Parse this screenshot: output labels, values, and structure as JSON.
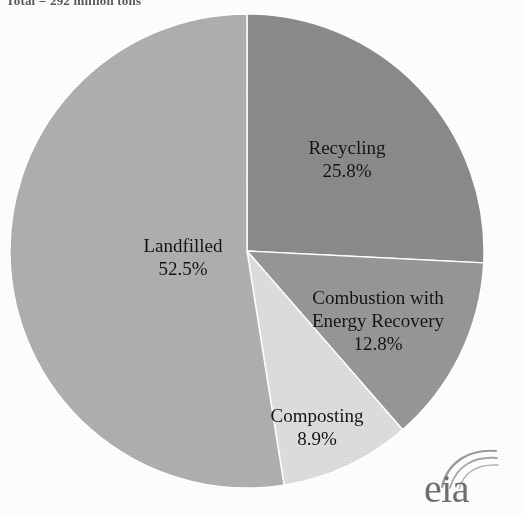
{
  "header": {
    "title": "Total = 292 million tons"
  },
  "logo": {
    "text": "eia",
    "swoosh": "arc-swoosh-icon"
  },
  "chart_data": {
    "type": "pie",
    "title": "Total = 292 million tons",
    "start_angle_deg": 0,
    "direction": "clockwise",
    "legend": "none",
    "grid": false,
    "categories": [
      "Recycling",
      "Combustion with Energy Recovery",
      "Composting",
      "Landfilled"
    ],
    "values": [
      25.8,
      12.8,
      8.9,
      52.5
    ],
    "unit": "%",
    "colors": [
      "#8a8a8a",
      "#969696",
      "#dcdcdc",
      "#aeaeae"
    ],
    "slices": [
      {
        "name": "Recycling",
        "label_line1": "Recycling",
        "label_line2": "25.8%",
        "value": 25.8,
        "color": "#8a8a8a"
      },
      {
        "name": "Combustion with Energy Recovery",
        "label_line1": "Combustion with",
        "label_line2": "Energy Recovery",
        "label_line3": "12.8%",
        "value": 12.8,
        "color": "#969696"
      },
      {
        "name": "Composting",
        "label_line1": "Composting",
        "label_line2": "8.9%",
        "value": 8.9,
        "color": "#dcdcdc"
      },
      {
        "name": "Landfilled",
        "label_line1": "Landfilled",
        "label_line2": "52.5%",
        "value": 52.5,
        "color": "#aeaeae"
      }
    ]
  }
}
